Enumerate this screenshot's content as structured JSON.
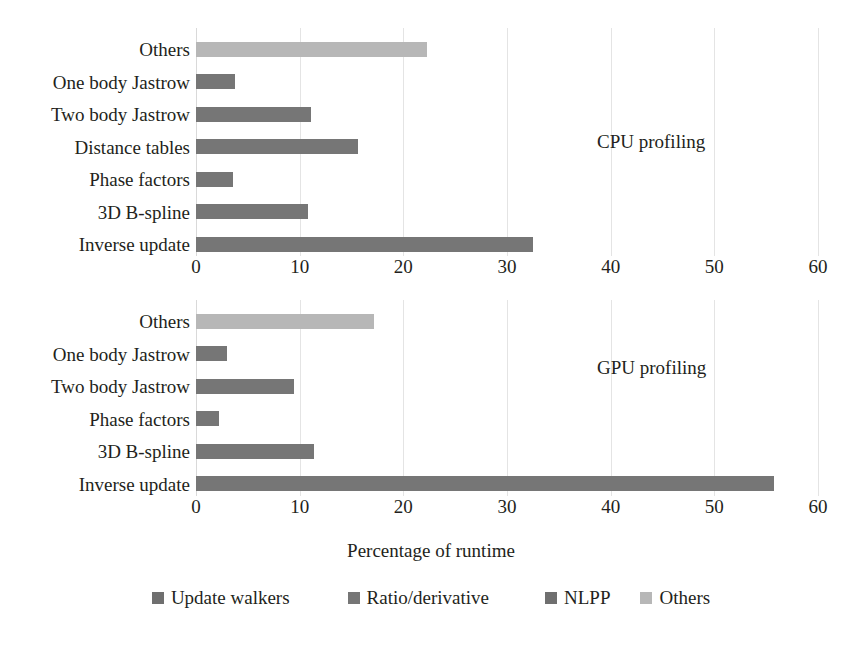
{
  "figure": {
    "x_axis_title": "Percentage of runtime",
    "legend": [
      {
        "label": "Update walkers",
        "color": "#6f6f6f"
      },
      {
        "label": "Ratio/derivative",
        "color": "#767676"
      },
      {
        "label": "NLPP",
        "color": "#6f6f6f"
      },
      {
        "label": "Others",
        "color": "#b7b7b7"
      }
    ]
  },
  "panels": [
    {
      "note": "CPU profiling",
      "xticks": [
        "0",
        "10",
        "20",
        "30",
        "40",
        "50",
        "60"
      ],
      "categories": [
        "Inverse update",
        "3D B-spline",
        "Phase factors",
        "Distance tables",
        "Two body Jastrow",
        "One body Jastrow",
        "Others"
      ]
    },
    {
      "note": "GPU profiling",
      "xticks": [
        "0",
        "10",
        "20",
        "30",
        "40",
        "50",
        "60"
      ],
      "categories": [
        "Inverse update",
        "3D B-spline",
        "Phase factors",
        "Two body Jastrow",
        "One body Jastrow",
        "Others"
      ]
    }
  ],
  "chart_data": [
    {
      "type": "bar",
      "orientation": "horizontal",
      "title": "CPU profiling",
      "xlabel": "Percentage of runtime",
      "ylabel": "",
      "xlim": [
        0,
        60
      ],
      "xticks": [
        0,
        10,
        20,
        30,
        40,
        50,
        60
      ],
      "grid": true,
      "legend_position": "bottom",
      "categories": [
        "Inverse update",
        "3D B-spline",
        "Phase factors",
        "Distance tables",
        "Two body Jastrow",
        "One body Jastrow",
        "Others"
      ],
      "values": [
        32.5,
        10.8,
        3.6,
        15.6,
        11.1,
        3.8,
        22.3
      ],
      "colors": [
        "#767676",
        "#767676",
        "#767676",
        "#767676",
        "#767676",
        "#767676",
        "#b7b7b7"
      ]
    },
    {
      "type": "bar",
      "orientation": "horizontal",
      "title": "GPU profiling",
      "xlabel": "Percentage of runtime",
      "ylabel": "",
      "xlim": [
        0,
        60
      ],
      "xticks": [
        0,
        10,
        20,
        30,
        40,
        50,
        60
      ],
      "grid": true,
      "legend_position": "bottom",
      "categories": [
        "Inverse update",
        "3D B-spline",
        "Phase factors",
        "Two body Jastrow",
        "One body Jastrow",
        "Others"
      ],
      "values": [
        55.8,
        11.4,
        2.2,
        9.5,
        3.0,
        17.2
      ],
      "colors": [
        "#767676",
        "#767676",
        "#767676",
        "#767676",
        "#767676",
        "#b7b7b7"
      ]
    }
  ]
}
